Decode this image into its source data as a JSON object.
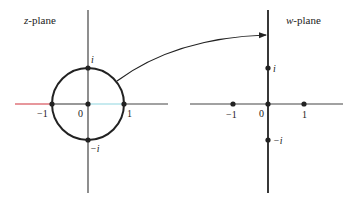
{
  "z_plane": {
    "title_var": "z",
    "title_suffix": "-plane",
    "labels": {
      "origin": "0",
      "one": "1",
      "neg_one": "−1",
      "i": "i",
      "neg_i": "−i"
    },
    "unit_circle": true,
    "highlighted_segments": [
      {
        "from": "-∞",
        "to": "-1",
        "color": "#d0303a"
      },
      {
        "from": "0",
        "to": "1",
        "color": "#8fd6e0"
      }
    ]
  },
  "w_plane": {
    "title_var": "w",
    "title_suffix": "-plane",
    "labels": {
      "origin": "0",
      "one": "1",
      "neg_one": "−1",
      "i": "i",
      "neg_i": "−i"
    }
  },
  "mapping_arrow": {
    "from": "unit circle in z-plane",
    "to": "upper imaginary axis in w-plane"
  },
  "colors": {
    "ink": "#222222",
    "axis": "#333333",
    "red_segment": "#d0303a",
    "cyan_segment": "#8fd6e0"
  }
}
